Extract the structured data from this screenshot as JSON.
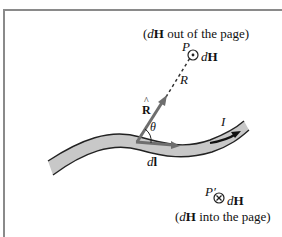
{
  "figure": {
    "caption_top": {
      "prefix": "(",
      "d": "d",
      "H": "H",
      "suffix": " out of the page)"
    },
    "caption_bottom": {
      "prefix": "(",
      "d": "d",
      "H": "H",
      "suffix": " into the page)"
    },
    "point_P": {
      "label": "P",
      "field_d": "d",
      "field_H": "H",
      "symbol": "dot-out-of-page"
    },
    "point_P_prime": {
      "label": "P′",
      "field_d": "d",
      "field_H": "H",
      "symbol": "cross-into-page"
    },
    "distance_label": "R",
    "unit_vector_label": "R",
    "unit_vector_hat": "^",
    "angle_label": "θ",
    "current_element": {
      "d": "d",
      "l": "l"
    },
    "current_label": "I"
  },
  "colors": {
    "conductor_fill": "#c8c8c8",
    "conductor_edge": "#222222",
    "vector_gray": "#6e6e6e",
    "frame": "#8a8a8a",
    "text": "#111111"
  }
}
